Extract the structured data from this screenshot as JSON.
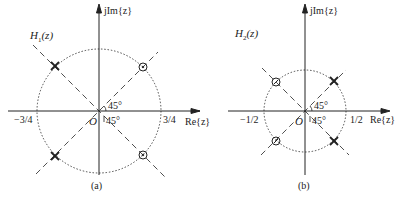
{
  "panels": [
    {
      "id": "a",
      "title": "H1(z)",
      "title_main": "H",
      "title_sub": "1",
      "title_rest": "(z)",
      "yaxis_label": "jIm{z}",
      "xaxis_label": "Re{z}",
      "neg_radius_label": "−3/4",
      "pos_radius_label": "3/4",
      "origin_label": "O",
      "angle_upper": "45°",
      "angle_lower": "45°",
      "caption": "(a)",
      "radius": 0.75,
      "poles": [
        "0.75∠135°",
        "0.75∠−135°"
      ],
      "zeros": [
        "0.75∠45°",
        "0.75∠−45°"
      ]
    },
    {
      "id": "b",
      "title": "H2(z)",
      "title_main": "H",
      "title_sub": "2",
      "title_rest": "(z)",
      "yaxis_label": "jIm{z}",
      "xaxis_label": "Re{z}",
      "neg_radius_label": "−1/2",
      "pos_radius_label": "1/2",
      "origin_label": "O",
      "angle_upper": "45°",
      "angle_lower": "45°",
      "caption": "(b)",
      "radius": 0.5,
      "poles": [
        "0.5∠45°",
        "0.5∠−45°"
      ],
      "zeros": [
        "0.5∠135°",
        "0.5∠−135°"
      ]
    }
  ]
}
